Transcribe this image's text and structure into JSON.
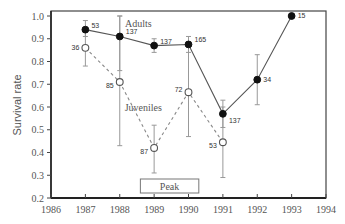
{
  "chart_data": {
    "type": "line",
    "title": "",
    "xlabel": "",
    "ylabel": "Survival rate",
    "xlim": [
      1986,
      1994
    ],
    "ylim": [
      0.2,
      1.0
    ],
    "x_ticks": [
      1986,
      1987,
      1988,
      1989,
      1990,
      1991,
      1992,
      1993,
      1994
    ],
    "y_ticks": [
      0.2,
      0.3,
      0.4,
      0.5,
      0.6,
      0.7,
      0.8,
      0.9,
      1.0
    ],
    "y_tick_labels": [
      "0.2",
      "0.3",
      "0.4",
      "0.5",
      "0.6",
      "0.7",
      "0.8",
      "0.9",
      "1.0"
    ],
    "grid": false,
    "series": [
      {
        "name": "Adults",
        "marker": "filled-circle",
        "line": "solid",
        "x": [
          1987,
          1988,
          1989,
          1990,
          1991,
          1992,
          1993
        ],
        "values": [
          0.94,
          0.91,
          0.87,
          0.875,
          0.57,
          0.72,
          1.0
        ],
        "err_low": [
          0.91,
          0.76,
          0.84,
          0.84,
          0.51,
          0.61,
          null
        ],
        "err_high": [
          0.98,
          1.0,
          0.9,
          0.91,
          0.63,
          0.83,
          null
        ],
        "n_labels": [
          "53",
          "137",
          "137",
          "165",
          "137",
          "34",
          "15"
        ]
      },
      {
        "name": "Juveniles",
        "marker": "open-circle",
        "line": "dashed",
        "x": [
          1987,
          1988,
          1989,
          1990,
          1991
        ],
        "values": [
          0.86,
          0.71,
          0.42,
          0.665,
          0.445
        ],
        "err_low": [
          0.78,
          0.43,
          0.31,
          0.47,
          0.29
        ],
        "err_high": [
          0.94,
          1.0,
          0.52,
          0.87,
          0.6
        ],
        "n_labels": [
          "36",
          "85",
          "87",
          "72",
          "53"
        ]
      }
    ],
    "annotations": [
      {
        "text": "Adults",
        "x": 1988.5,
        "y": 0.97
      },
      {
        "text": "Juveniles",
        "x": 1988.55,
        "y": 0.6
      },
      {
        "text": "Peak",
        "box": [
          1988.6,
          1990.3
        ],
        "y": 0.255
      }
    ]
  },
  "labels": {
    "adults": "Adults",
    "juveniles": "Juveniles",
    "peak": "Peak",
    "ylabel": "Survival rate"
  }
}
